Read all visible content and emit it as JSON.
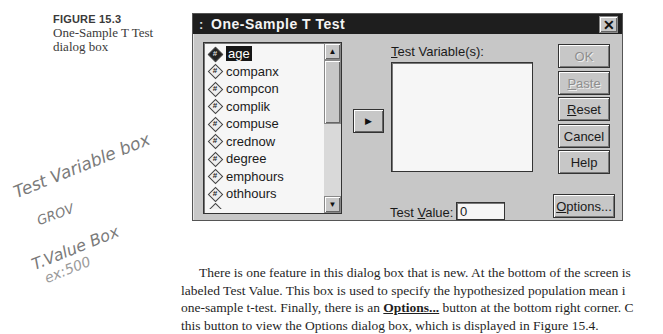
{
  "caption": {
    "figure_label": "FIGURE 15.3",
    "title_line1": "One-Sample T Test",
    "title_line2": "dialog box"
  },
  "handwritten_notes": [
    "Test Variable box",
    "GROV",
    "T.Value Box",
    "ex:500"
  ],
  "dialog": {
    "title": "One-Sample T Test",
    "system_icon": ":",
    "close_label": "✕",
    "source_list": {
      "items": [
        {
          "label": "age",
          "icon": "#",
          "selected": true
        },
        {
          "label": "companx",
          "icon": "#",
          "selected": false
        },
        {
          "label": "compcon",
          "icon": "#",
          "selected": false
        },
        {
          "label": "complik",
          "icon": "#",
          "selected": false
        },
        {
          "label": "compuse",
          "icon": "#",
          "selected": false
        },
        {
          "label": "crednow",
          "icon": "#",
          "selected": false
        },
        {
          "label": "degree",
          "icon": "#",
          "selected": false
        },
        {
          "label": "emphours",
          "icon": "#",
          "selected": false
        },
        {
          "label": "othhours",
          "icon": "#",
          "selected": false
        }
      ],
      "scroll_up_glyph": "▲",
      "scroll_down_glyph": "▼"
    },
    "move_button_glyph": "▶",
    "test_variables": {
      "label_prefix": "",
      "label_mnemonic": "T",
      "label_rest": "est Variable(s):"
    },
    "test_value": {
      "label_prefix": "Test ",
      "label_mnemonic": "V",
      "label_rest": "alue:",
      "value": "0"
    },
    "buttons": {
      "ok": "OK",
      "paste_mnemonic": "P",
      "paste_rest": "aste",
      "reset_mnemonic": "R",
      "reset_rest": "eset",
      "cancel": "Cancel",
      "help": "Help",
      "options_mnemonic": "O",
      "options_rest": "ptions..."
    }
  },
  "body_text": {
    "line1": "There is one feature in this dialog box that is new. At the bottom of the screen is",
    "line2": "labeled Test Value. This box is used to specify the hypothesized population mean i",
    "line3_before": "one-sample t-test. Finally, there is an ",
    "line3_bold": "Options...",
    "line3_after": " button at the bottom right corner. C",
    "line4": "this button to view the Options dialog box, which is displayed in Figure 15.4."
  }
}
